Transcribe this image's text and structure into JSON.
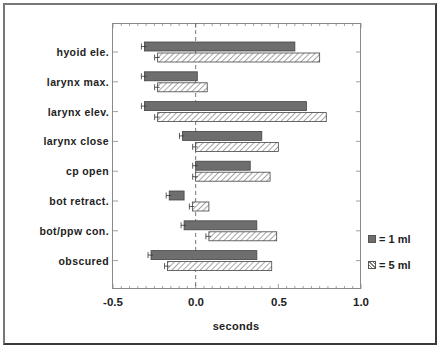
{
  "chart_data": {
    "type": "bar",
    "orientation": "horizontal",
    "title": "",
    "xlabel": "seconds",
    "ylabel": "",
    "xlim": [
      -0.5,
      1.0
    ],
    "x_ticks": [
      "-0.5",
      "0.0",
      "0.5",
      "1.0"
    ],
    "reference_line": 0.0,
    "categories": [
      "hyoid ele.",
      "larynx max.",
      "larynx elev.",
      "larynx close",
      "cp open",
      "bot retract.",
      "bot/ppw con.",
      "obscured"
    ],
    "series": [
      {
        "name": "1 ml",
        "style": "solid gray",
        "start": [
          -0.31,
          -0.31,
          -0.31,
          -0.08,
          0.0,
          -0.16,
          -0.07,
          -0.27
        ],
        "end": [
          0.6,
          0.01,
          0.67,
          0.4,
          0.33,
          -0.07,
          0.37,
          0.37
        ]
      },
      {
        "name": "5 ml",
        "style": "hatched",
        "start": [
          -0.23,
          -0.23,
          -0.23,
          0.0,
          0.0,
          -0.02,
          0.08,
          -0.17
        ],
        "end": [
          0.75,
          0.07,
          0.79,
          0.5,
          0.45,
          0.08,
          0.49,
          0.46
        ]
      }
    ],
    "error_bars": "small error bars at bar start",
    "legend": {
      "position": "right",
      "entries": [
        "= 1 ml",
        "= 5 ml"
      ]
    }
  },
  "labels": {
    "categories": [
      "hyoid ele.",
      "larynx max.",
      "larynx elev.",
      "larynx close",
      "cp open",
      "bot retract.",
      "bot/ppw con.",
      "obscured"
    ],
    "x_ticks": [
      "-0.5",
      "0.0",
      "0.5",
      "1.0"
    ],
    "xlabel": "seconds",
    "legend_1": "= 1 ml",
    "legend_2": "= 5 ml"
  }
}
